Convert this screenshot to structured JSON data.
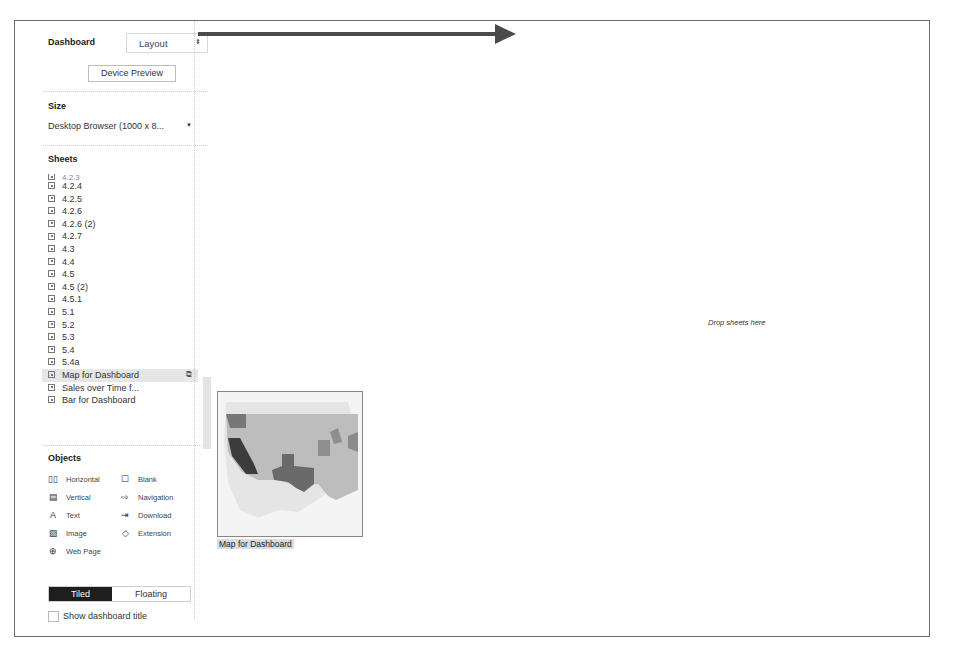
{
  "panel": {
    "tabs": {
      "dashboard": "Dashboard",
      "layout": "Layout",
      "layout_arrow": "⬍"
    },
    "device_preview_label": "Device Preview",
    "size": {
      "title": "Size",
      "value": "Desktop Browser (1000 x 8...",
      "dropdown_icon": "▼"
    },
    "sheets": {
      "title": "Sheets",
      "cut_item": "4.2.3",
      "items": [
        {
          "label": "4.2.4"
        },
        {
          "label": "4.2.5"
        },
        {
          "label": "4.2.6"
        },
        {
          "label": "4.2.6 (2)"
        },
        {
          "label": "4.2.7"
        },
        {
          "label": "4.3"
        },
        {
          "label": "4.4"
        },
        {
          "label": "4.5"
        },
        {
          "label": "4.5 (2)"
        },
        {
          "label": "4.5.1"
        },
        {
          "label": "5.1"
        },
        {
          "label": "5.2"
        },
        {
          "label": "5.3"
        },
        {
          "label": "5.4"
        },
        {
          "label": "5.4a"
        },
        {
          "label": "Map for Dashboard",
          "selected": true
        },
        {
          "label": "Sales over Time f..."
        },
        {
          "label": "Bar for Dashboard"
        }
      ],
      "open_icon": "⧉"
    },
    "objects": {
      "title": "Objects",
      "items": [
        {
          "label": "Horizontal",
          "icon": "▯▯"
        },
        {
          "label": "Blank",
          "icon": "☐"
        },
        {
          "label": "Vertical",
          "icon": "▤"
        },
        {
          "label": "Navigation",
          "icon": "⇨"
        },
        {
          "label": "Text",
          "icon": "A"
        },
        {
          "label": "Download",
          "icon": "⇥"
        },
        {
          "label": "Image",
          "icon": "▨"
        },
        {
          "label": "Extension",
          "icon": "◇"
        },
        {
          "label": "Web Page",
          "icon": "⊕"
        }
      ]
    },
    "layout_toggle": {
      "tiled": "Tiled",
      "floating": "Floating",
      "active": "Tiled"
    },
    "show_title_label": "Show dashboard title"
  },
  "canvas": {
    "drop_hint": "Drop sheets here",
    "dragged_sheet_label": "Map for Dashboard"
  },
  "colors": {
    "arrow": "#4a4a4a",
    "tiled_active_bg": "#1e1e1e",
    "selected_row_bg": "#e6e6e6"
  }
}
